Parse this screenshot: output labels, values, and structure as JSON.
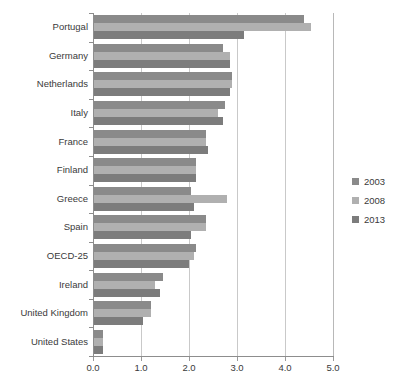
{
  "chart_data": {
    "type": "bar",
    "orientation": "horizontal",
    "title": "",
    "subtitle": "",
    "xlabel": "",
    "ylabel": "",
    "xlim": [
      0.0,
      5.0
    ],
    "xticks": [
      "0.0",
      "1.0",
      "2.0",
      "3.0",
      "4.0",
      "5.0"
    ],
    "xtick_values": [
      0.0,
      1.0,
      2.0,
      3.0,
      4.0,
      5.0
    ],
    "grid": "vertical",
    "legend_position": "right",
    "categories": [
      "Portugal",
      "Germany",
      "Netherlands",
      "Italy",
      "France",
      "Finland",
      "Greece",
      "Spain",
      "OECD-25",
      "Ireland",
      "United Kingdom",
      "United States"
    ],
    "series": [
      {
        "name": "2003",
        "color": "#8a8a8a",
        "values": [
          4.4,
          2.7,
          2.9,
          2.75,
          2.35,
          2.15,
          2.05,
          2.35,
          2.15,
          1.45,
          1.2,
          0.2
        ]
      },
      {
        "name": "2008",
        "color": "#b0b0b0",
        "values": [
          4.55,
          2.85,
          2.9,
          2.6,
          2.35,
          2.15,
          2.8,
          2.35,
          2.1,
          1.3,
          1.2,
          0.2
        ]
      },
      {
        "name": "2013",
        "color": "#7c7c7c",
        "values": [
          3.15,
          2.85,
          2.85,
          2.7,
          2.4,
          2.15,
          2.1,
          2.05,
          2.0,
          1.4,
          1.05,
          0.2
        ]
      }
    ]
  },
  "legend": {
    "entries": [
      {
        "label": "2003",
        "color": "#8a8a8a"
      },
      {
        "label": "2008",
        "color": "#b0b0b0"
      },
      {
        "label": "2013",
        "color": "#7c7c7c"
      }
    ]
  },
  "footer": {
    "cut_text": ""
  }
}
